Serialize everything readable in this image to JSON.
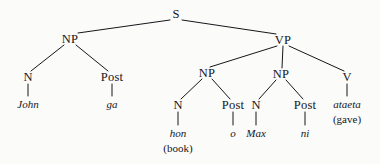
{
  "figure": {
    "type": "syntax-tree",
    "ink_color": "#16161a",
    "background_color": "#fbfbfa"
  },
  "nodes": [
    {
      "id": "s",
      "label": "S",
      "kind": "category",
      "x": 176,
      "y": 14
    },
    {
      "id": "np1",
      "label": "NP",
      "kind": "category",
      "x": 70,
      "y": 39
    },
    {
      "id": "vp",
      "label": "VP",
      "kind": "category",
      "x": 283,
      "y": 40
    },
    {
      "id": "n1",
      "label": "N",
      "kind": "category",
      "x": 28,
      "y": 77
    },
    {
      "id": "post1",
      "label": "Post",
      "kind": "category",
      "x": 112,
      "y": 77
    },
    {
      "id": "np2",
      "label": "NP",
      "kind": "category",
      "x": 207,
      "y": 73
    },
    {
      "id": "np3",
      "label": "NP",
      "kind": "category",
      "x": 281,
      "y": 74
    },
    {
      "id": "v",
      "label": "V",
      "kind": "category",
      "x": 347,
      "y": 77
    },
    {
      "id": "n2",
      "label": "N",
      "kind": "category",
      "x": 178,
      "y": 105
    },
    {
      "id": "post2",
      "label": "Post",
      "kind": "category",
      "x": 233,
      "y": 105
    },
    {
      "id": "n3",
      "label": "N",
      "kind": "category",
      "x": 256,
      "y": 105
    },
    {
      "id": "post3",
      "label": "Post",
      "kind": "category",
      "x": 305,
      "y": 105
    },
    {
      "id": "john",
      "label": "John",
      "kind": "terminal",
      "x": 28,
      "y": 104
    },
    {
      "id": "ga",
      "label": "ga",
      "kind": "terminal",
      "x": 112,
      "y": 104
    },
    {
      "id": "hon",
      "label": "hon",
      "kind": "terminal",
      "x": 178,
      "y": 133
    },
    {
      "id": "hon_gl",
      "label": "(book)",
      "kind": "gloss",
      "x": 178,
      "y": 148
    },
    {
      "id": "o",
      "label": "o",
      "kind": "terminal",
      "x": 233,
      "y": 133
    },
    {
      "id": "max",
      "label": "Max",
      "kind": "terminal",
      "x": 256,
      "y": 133
    },
    {
      "id": "ni",
      "label": "ni",
      "kind": "terminal",
      "x": 305,
      "y": 133
    },
    {
      "id": "ataeta",
      "label": "ataeta",
      "kind": "terminal",
      "x": 347,
      "y": 104
    },
    {
      "id": "ataeta_gl",
      "label": "(gave)",
      "kind": "gloss",
      "x": 347,
      "y": 119
    }
  ],
  "edges": [
    {
      "from": "s",
      "to": "np1",
      "x1": 170,
      "y1": 20,
      "x2": 78,
      "y2": 33
    },
    {
      "from": "s",
      "to": "vp",
      "x1": 182,
      "y1": 20,
      "x2": 276,
      "y2": 34
    },
    {
      "from": "np1",
      "to": "n1",
      "x1": 64,
      "y1": 45,
      "x2": 31,
      "y2": 71
    },
    {
      "from": "np1",
      "to": "post1",
      "x1": 76,
      "y1": 45,
      "x2": 108,
      "y2": 71
    },
    {
      "from": "vp",
      "to": "np2",
      "x1": 277,
      "y1": 46,
      "x2": 210,
      "y2": 67
    },
    {
      "from": "vp",
      "to": "np3",
      "x1": 283,
      "y1": 46,
      "x2": 282,
      "y2": 68
    },
    {
      "from": "vp",
      "to": "v",
      "x1": 289,
      "y1": 46,
      "x2": 344,
      "y2": 71
    },
    {
      "from": "np2",
      "to": "n2",
      "x1": 202,
      "y1": 79,
      "x2": 181,
      "y2": 99
    },
    {
      "from": "np2",
      "to": "post2",
      "x1": 212,
      "y1": 79,
      "x2": 230,
      "y2": 99
    },
    {
      "from": "np3",
      "to": "n3",
      "x1": 276,
      "y1": 80,
      "x2": 259,
      "y2": 99
    },
    {
      "from": "np3",
      "to": "post3",
      "x1": 286,
      "y1": 80,
      "x2": 303,
      "y2": 99
    },
    {
      "from": "n1",
      "to": "john",
      "x1": 28,
      "y1": 84,
      "x2": 28,
      "y2": 96
    },
    {
      "from": "post1",
      "to": "ga",
      "x1": 112,
      "y1": 84,
      "x2": 112,
      "y2": 96
    },
    {
      "from": "n2",
      "to": "hon",
      "x1": 178,
      "y1": 112,
      "x2": 178,
      "y2": 125
    },
    {
      "from": "post2",
      "to": "o",
      "x1": 233,
      "y1": 112,
      "x2": 233,
      "y2": 125
    },
    {
      "from": "n3",
      "to": "max",
      "x1": 256,
      "y1": 112,
      "x2": 256,
      "y2": 125
    },
    {
      "from": "post3",
      "to": "ni",
      "x1": 305,
      "y1": 112,
      "x2": 305,
      "y2": 125
    },
    {
      "from": "v",
      "to": "ataeta",
      "x1": 347,
      "y1": 84,
      "x2": 347,
      "y2": 96
    }
  ]
}
